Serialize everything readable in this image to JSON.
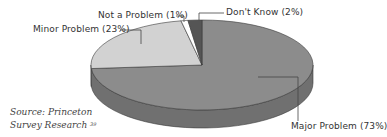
{
  "chart_data": {
    "type": "pie",
    "style": "3d-oval",
    "title": "",
    "categories": [
      "Major Problem",
      "Minor Problem",
      "Not a Problem",
      "Don't Know"
    ],
    "values": [
      73,
      23,
      1,
      2
    ],
    "unit": "%",
    "colors": [
      "#8c8c8c",
      "#d2d2d2",
      "#ffffff",
      "#555555"
    ],
    "side_colors": [
      "#707070",
      "#a8a8a8",
      "#cccccc",
      "#3a3a3a"
    ],
    "labels": [
      "Major Problem (73%)",
      "Minor Problem (23%)",
      "Not a Problem (1%)",
      "Don't Know (2%)"
    ],
    "legend": "none (leader-line labels)",
    "source": "Source: Princeton Survey Research",
    "footnote": "39"
  }
}
